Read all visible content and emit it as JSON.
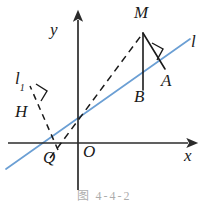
{
  "figure": {
    "caption": "图 4-4-2",
    "colors": {
      "axis": "#2b2b2b",
      "solid_segment": "#1a1a1a",
      "dashed_segment": "#1a1a1a",
      "line_l": "#6b9fd4",
      "label": "#1a1a1a",
      "background": "#ffffff"
    },
    "axes": {
      "x_label": "x",
      "y_label": "y",
      "origin_label": "O",
      "x_axis": {
        "from": [
          8,
          143
        ],
        "to": [
          196,
          143
        ]
      },
      "y_axis": {
        "from": [
          78,
          190
        ],
        "to": [
          78,
          14
        ]
      }
    },
    "lines": [
      {
        "name": "line-l",
        "label": "l",
        "style": "solid",
        "color": "#6b9fd4",
        "from": [
          6,
          169
        ],
        "to": [
          190,
          39
        ]
      },
      {
        "name": "line-MQ",
        "label": "",
        "style": "dashed",
        "color": "#1a1a1a",
        "from": [
          52,
          155
        ],
        "to": [
          143,
          33
        ]
      },
      {
        "name": "line-l1-perpendicular",
        "label": "l₁",
        "style": "dashed",
        "color": "#1a1a1a",
        "from": [
          57,
          150
        ],
        "to": [
          33,
          93
        ]
      }
    ],
    "segments": [
      {
        "name": "segment-MB",
        "from": [
          143,
          33
        ],
        "to": [
          143,
          89
        ],
        "style": "solid"
      },
      {
        "name": "segment-MA",
        "from": [
          143,
          33
        ],
        "to": [
          164,
          68
        ],
        "style": "solid"
      }
    ],
    "right_angles": [
      {
        "name": "right-angle-at-A",
        "vertex": [
          164,
          68
        ]
      },
      {
        "name": "right-angle-at-H",
        "vertex": [
          44,
          101
        ]
      }
    ],
    "points": [
      {
        "name": "point-M",
        "label": "M",
        "x": 134,
        "y": 6,
        "interactable": false
      },
      {
        "name": "point-A",
        "label": "A",
        "x": 162,
        "y": 72,
        "interactable": false
      },
      {
        "name": "point-B",
        "label": "B",
        "x": 135,
        "y": 88,
        "interactable": false
      },
      {
        "name": "point-H",
        "label": "H",
        "x": 16,
        "y": 104,
        "interactable": false
      },
      {
        "name": "point-Q",
        "label": "Q",
        "x": 44,
        "y": 150,
        "interactable": false
      },
      {
        "name": "point-O",
        "label": "O",
        "x": 83,
        "y": 144,
        "interactable": false
      }
    ],
    "line_labels": [
      {
        "name": "label-line-l",
        "label": "l",
        "sub": "",
        "x": 191,
        "y": 34
      },
      {
        "name": "label-line-l1",
        "label": "l",
        "sub": "1",
        "x": 15,
        "y": 71
      }
    ],
    "axis_labels": [
      {
        "name": "label-axis-y",
        "label": "y",
        "x": 50,
        "y": 22
      },
      {
        "name": "label-axis-x",
        "label": "x",
        "x": 185,
        "y": 148
      }
    ]
  }
}
